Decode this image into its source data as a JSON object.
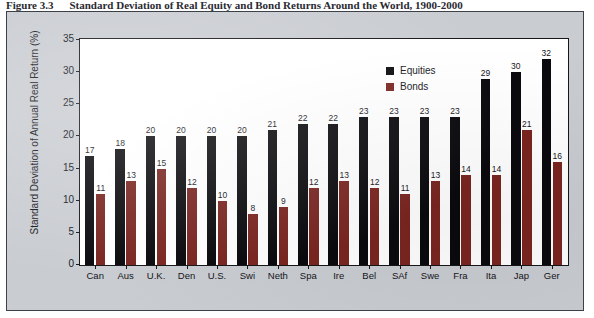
{
  "figure": {
    "number": "Figure 3.3",
    "caption": "Standard Deviation of Real Equity and Bond Returns Around the World, 1900-2000"
  },
  "legend": {
    "position": "top-right",
    "entries": [
      {
        "label": "Equities",
        "color": "#0a0a0e"
      },
      {
        "label": "Bonds",
        "color": "#7a2520"
      }
    ]
  },
  "axis": {
    "y_title": "Standard Deviation of Annual Real Return (%)",
    "y_ticks": [
      "0",
      "5",
      "10",
      "15",
      "20",
      "25",
      "30",
      "35"
    ]
  },
  "chart_data": {
    "type": "bar",
    "title": "Standard Deviation of Real Equity and Bond Returns Around the World, 1900-2000",
    "xlabel": "",
    "ylabel": "Standard Deviation of Annual Real Return (%)",
    "ylim": [
      0,
      35
    ],
    "ytick_step": 5,
    "grid": false,
    "legend_position": "top-right",
    "categories": [
      "Can",
      "Aus",
      "U.K.",
      "Den",
      "U.S.",
      "Swi",
      "Neth",
      "Spa",
      "Ire",
      "Bel",
      "SAf",
      "Swe",
      "Fra",
      "Ita",
      "Jap",
      "Ger"
    ],
    "series": [
      {
        "name": "Equities",
        "color": "#0a0a0e",
        "values": [
          17,
          18,
          20,
          20,
          20,
          20,
          21,
          22,
          22,
          23,
          23,
          23,
          23,
          29,
          30,
          32
        ]
      },
      {
        "name": "Bonds",
        "color": "#7a2520",
        "values": [
          11,
          13,
          15,
          12,
          10,
          8,
          9,
          12,
          13,
          12,
          11,
          13,
          14,
          14,
          21,
          16
        ]
      }
    ]
  }
}
